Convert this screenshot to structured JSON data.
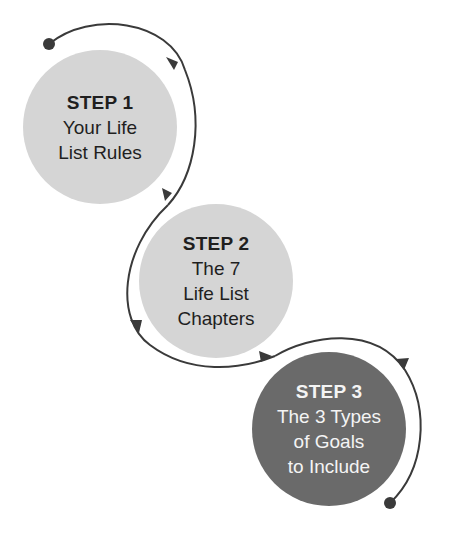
{
  "diagram": {
    "type": "process-flow",
    "colors": {
      "light_circle": "#d5d5d5",
      "dark_circle": "#6a6a6a",
      "connector": "#3a3a3a",
      "text_dark": "#1f1f1f",
      "text_light": "#f4f4f4"
    },
    "steps": [
      {
        "title": "STEP 1",
        "lines": [
          "Your Life",
          "List Rules"
        ]
      },
      {
        "title": "STEP 2",
        "lines": [
          "The 7",
          "Life List",
          "Chapters"
        ]
      },
      {
        "title": "STEP 3",
        "lines": [
          "The 3 Types",
          "of Goals",
          "to Include"
        ]
      }
    ],
    "connector": {
      "start": "dot",
      "end": "dot",
      "arrows": 5
    }
  }
}
